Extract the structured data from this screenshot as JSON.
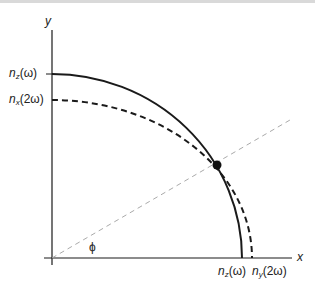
{
  "diagram": {
    "title": "",
    "axes": {
      "x_label": "x",
      "y_label": "y",
      "angle_label": "ϕ"
    },
    "curves": [
      {
        "name": "n_z(ω)",
        "style": "solid",
        "y_intercept_label": {
          "n": "n",
          "sub": "z",
          "arg": "(ω)"
        },
        "x_intercept_label": {
          "n": "n",
          "sub": "z",
          "arg": "(ω)"
        }
      },
      {
        "name": "n_x(2ω)/n_y(2ω)",
        "style": "dashed",
        "y_intercept_label": {
          "n": "n",
          "sub": "x",
          "arg": "(2ω)"
        },
        "x_intercept_label": {
          "n": "n",
          "sub": "y",
          "arg": "(2ω)"
        }
      }
    ],
    "intersection_point": "phase-matching point",
    "colors": {
      "line": "#1a1a1a",
      "guide": "#aaaaaa",
      "background": "#ffffff"
    }
  }
}
